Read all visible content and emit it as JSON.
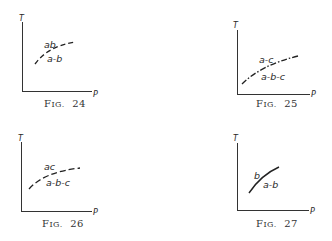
{
  "figures": [
    {
      "id": "fig24",
      "caption": {
        "prefix": "F",
        "smallcaps": "IG.",
        "number": "24"
      },
      "axes": {
        "y_label": "T",
        "x_label": "P"
      },
      "curve_style": "dashed",
      "labels": {
        "above": "ab",
        "below": "a-b"
      }
    },
    {
      "id": "fig25",
      "caption": {
        "prefix": "F",
        "smallcaps": "IG.",
        "number": "25"
      },
      "axes": {
        "y_label": "T",
        "x_label": "P"
      },
      "curve_style": "dash-dot",
      "labels": {
        "above": "a-c",
        "below": "a-b-c"
      }
    },
    {
      "id": "fig26",
      "caption": {
        "prefix": "F",
        "smallcaps": "IG.",
        "number": "26"
      },
      "axes": {
        "y_label": "T",
        "x_label": "P"
      },
      "curve_style": "dashed",
      "labels": {
        "above": "ac",
        "below": "a-b-c"
      }
    },
    {
      "id": "fig27",
      "caption": {
        "prefix": "F",
        "smallcaps": "IG.",
        "number": "27"
      },
      "axes": {
        "y_label": "T",
        "x_label": "P"
      },
      "curve_style": "solid",
      "labels": {
        "above": "b",
        "below": "a-b"
      }
    }
  ]
}
